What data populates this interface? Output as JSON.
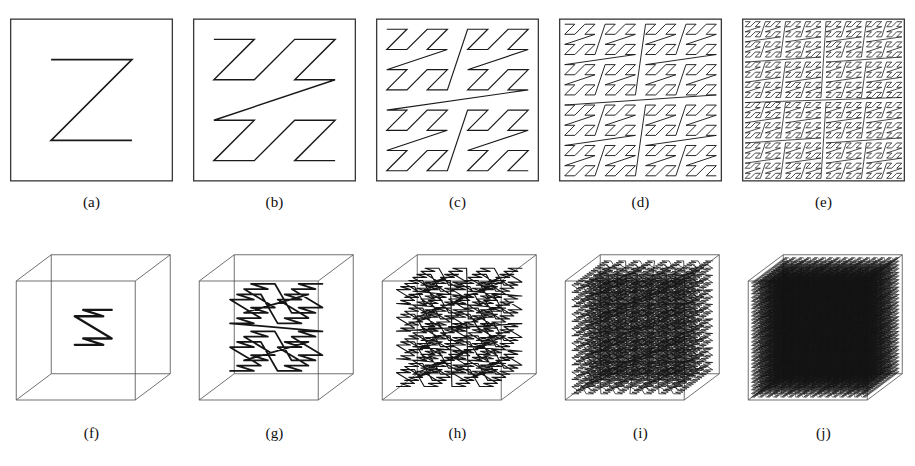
{
  "figure": {
    "background_color": "#ffffff",
    "stroke_color": "#1a1a1a",
    "frame_color": "#3a3a3a",
    "rows": 2,
    "columns": 5
  },
  "row_2d": {
    "name": "two-dimensional-space-filling-curve-iterations",
    "description": "Square frame containing successive iterations of a planar space-filling curve",
    "panels": [
      {
        "label": "(a)",
        "id": "panel-a",
        "iteration": 1,
        "order": 1,
        "segments": 3,
        "grid": 2,
        "kind": "2d-curve"
      },
      {
        "label": "(b)",
        "id": "panel-b",
        "iteration": 2,
        "order": 2,
        "segments": 15,
        "grid": 4,
        "kind": "2d-curve"
      },
      {
        "label": "(c)",
        "id": "panel-c",
        "iteration": 3,
        "order": 3,
        "segments": 63,
        "grid": 8,
        "kind": "2d-curve"
      },
      {
        "label": "(d)",
        "id": "panel-d",
        "iteration": 4,
        "order": 4,
        "segments": 255,
        "grid": 16,
        "kind": "2d-curve"
      },
      {
        "label": "(e)",
        "id": "panel-e",
        "iteration": 5,
        "order": 5,
        "segments": 1023,
        "grid": 32,
        "kind": "2d-curve"
      }
    ]
  },
  "row_3d": {
    "name": "three-dimensional-space-filling-curve-iterations",
    "description": "Wireframe cube containing successive iterations of a spatial space-filling curve",
    "cube": {
      "front_face": true,
      "back_face": true,
      "projection": "oblique",
      "edge_color": "#444444"
    },
    "panels": [
      {
        "label": "(f)",
        "id": "panel-f",
        "iteration": 1,
        "order": 1,
        "grid": 2,
        "kind": "3d-curve"
      },
      {
        "label": "(g)",
        "id": "panel-g",
        "iteration": 2,
        "order": 2,
        "grid": 4,
        "kind": "3d-curve"
      },
      {
        "label": "(h)",
        "id": "panel-h",
        "iteration": 3,
        "order": 3,
        "grid": 8,
        "kind": "3d-curve"
      },
      {
        "label": "(i)",
        "id": "panel-i",
        "iteration": 4,
        "order": 4,
        "grid": 16,
        "kind": "3d-curve"
      },
      {
        "label": "(j)",
        "id": "panel-j",
        "iteration": 5,
        "order": 5,
        "grid": 24,
        "kind": "3d-curve"
      }
    ]
  },
  "chart_data": {
    "type": "line",
    "xlabel": "",
    "ylabel": "",
    "series": [
      {
        "name": "(a) 2D order 1",
        "grid": 2,
        "segments": 3
      },
      {
        "name": "(b) 2D order 2",
        "grid": 4,
        "segments": 15
      },
      {
        "name": "(c) 2D order 3",
        "grid": 8,
        "segments": 63
      },
      {
        "name": "(d) 2D order 4",
        "grid": 16,
        "segments": 255
      },
      {
        "name": "(e) 2D order 5",
        "grid": 32,
        "segments": 1023
      },
      {
        "name": "(f) 3D order 1",
        "grid": 2,
        "segments": 7
      },
      {
        "name": "(g) 3D order 2",
        "grid": 4,
        "segments": 63
      },
      {
        "name": "(h) 3D order 3",
        "grid": 8,
        "segments": 511
      },
      {
        "name": "(i) 3D order 4",
        "grid": 16,
        "segments": 4095
      },
      {
        "name": "(j) 3D order 5",
        "grid": 24,
        "segments": 13823
      }
    ],
    "legend": "none",
    "grid": false
  }
}
